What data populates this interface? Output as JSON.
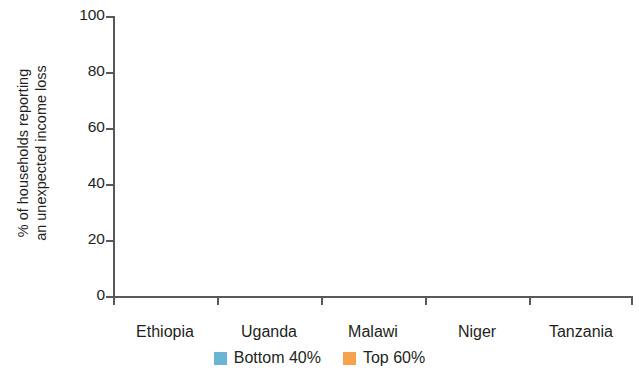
{
  "chart_data": {
    "type": "bar",
    "title": "",
    "xlabel": "",
    "ylabel": "% of households reporting an unexpected income loss",
    "ylabel_line1": "% of households reporting",
    "ylabel_line2": "an unexpected income loss",
    "categories": [
      "Ethiopia",
      "Uganda",
      "Malawi",
      "Niger",
      "Tanzania"
    ],
    "series": [
      {
        "name": "Bottom 40%",
        "color": "#6cb4d4",
        "values": [
          89,
          81.5,
          78.5,
          77.5,
          59.5
        ]
      },
      {
        "name": "Top 60%",
        "color": "#f6a44b",
        "values": [
          84,
          77,
          76.5,
          77.5,
          58.5
        ]
      }
    ],
    "ylim": [
      0,
      100
    ],
    "yticks": [
      0,
      20,
      40,
      60,
      80,
      100
    ],
    "ytick_labels": [
      "0",
      "20",
      "40",
      "60",
      "80",
      "100"
    ],
    "grid": false,
    "legend_position": "bottom"
  },
  "axis": {
    "y_tick_0": "0",
    "y_tick_1": "20",
    "y_tick_2": "40",
    "y_tick_3": "60",
    "y_tick_4": "80",
    "y_tick_5": "100"
  },
  "categories": {
    "c0": "Ethiopia",
    "c1": "Uganda",
    "c2": "Malawi",
    "c3": "Niger",
    "c4": "Tanzania"
  },
  "legend": {
    "item0": "Bottom 40%",
    "item1": "Top 60%"
  },
  "colors": {
    "blue": "#6cb4d4",
    "orange": "#f6a44b",
    "axis": "#58595b",
    "text": "#231f20",
    "background": "#ffffff"
  }
}
